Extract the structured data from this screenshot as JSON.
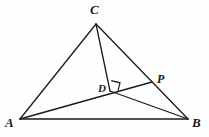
{
  "figure": {
    "kind": "euclidean-geometry-diagram",
    "background_color": "#fefefe",
    "stroke_color": "#1a1a1a",
    "canvas": {
      "width": 209,
      "height": 137
    }
  },
  "points": {
    "A": {
      "label": "A",
      "x": 20,
      "y": 119
    },
    "B": {
      "label": "B",
      "x": 188,
      "y": 119
    },
    "C": {
      "label": "C",
      "x": 96,
      "y": 24
    },
    "D": {
      "label": "D",
      "x": 110,
      "y": 91
    },
    "P": {
      "label": "P",
      "x": 152,
      "y": 82
    }
  },
  "segments": [
    {
      "name": "side-AB",
      "from": "A",
      "to": "B"
    },
    {
      "name": "side-AC",
      "from": "A",
      "to": "C"
    },
    {
      "name": "side-CB",
      "from": "C",
      "to": "B"
    },
    {
      "name": "cevian-CD",
      "from": "C",
      "to": "D"
    },
    {
      "name": "segment-AP",
      "from": "A",
      "to": "P"
    },
    {
      "name": "segment-DB",
      "from": "D",
      "to": "B"
    }
  ],
  "marks": [
    {
      "name": "right-angle-at-D",
      "type": "right-angle-square",
      "at": "D",
      "between": [
        "cevian-CD",
        "segment-DP"
      ],
      "size": 9
    }
  ]
}
